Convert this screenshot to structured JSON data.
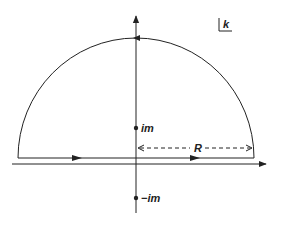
{
  "diagram": {
    "type": "contour-integral",
    "plane_label": "k",
    "colors": {
      "stroke": "#222222",
      "background": "#ffffff"
    },
    "axes": {
      "horizontal": {
        "label": "",
        "direction": "right"
      },
      "vertical": {
        "label": "",
        "direction": "up"
      }
    },
    "contour": {
      "shape": "semicircle-upper-half-plane",
      "radius_label": "R",
      "orientation": "counterclockwise"
    },
    "points": [
      {
        "name": "pole-upper",
        "label": "im"
      },
      {
        "name": "pole-lower",
        "label": "−im"
      }
    ]
  }
}
